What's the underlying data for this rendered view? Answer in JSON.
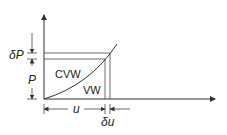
{
  "diagram": {
    "type": "work-diagram",
    "labels": {
      "delta_p": "δP",
      "p": "P",
      "cvw": "CVW",
      "vw": "VW",
      "u": "u",
      "delta_u": "δu"
    },
    "colors": {
      "stroke": "#333333",
      "background": "#ffffff"
    }
  }
}
